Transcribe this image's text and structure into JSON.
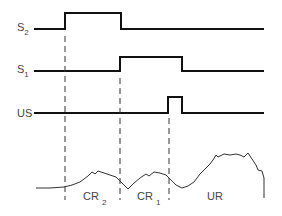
{
  "signals": [
    {
      "label": "S",
      "subscript": "2",
      "name": "S2"
    },
    {
      "label": "S",
      "subscript": "1",
      "name": "S1"
    },
    {
      "label": "US",
      "subscript": "",
      "name": "US"
    }
  ],
  "regions": [
    {
      "label": "CR",
      "subscript": "2"
    },
    {
      "label": "CR",
      "subscript": "1"
    },
    {
      "label": "UR",
      "subscript": ""
    }
  ]
}
